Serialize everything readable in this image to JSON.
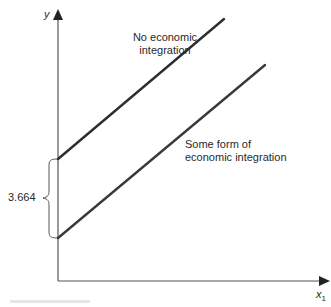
{
  "axes": {
    "y_label": "y",
    "x_label": "x",
    "x_subscript": "1"
  },
  "lines": [
    {
      "name": "upper",
      "label_line1": "No economic",
      "label_line2": "integration",
      "x1": 58,
      "y1": 159,
      "x2": 224,
      "y2": 19
    },
    {
      "name": "lower",
      "label_line1": "Some form of",
      "label_line2": "economic integration",
      "x1": 58,
      "y1": 238,
      "x2": 265,
      "y2": 65
    }
  ],
  "annotation": {
    "gap_value": "3.664"
  },
  "colors": {
    "axis": "#555555",
    "line": "#333333",
    "text": "#2a2a2a"
  }
}
